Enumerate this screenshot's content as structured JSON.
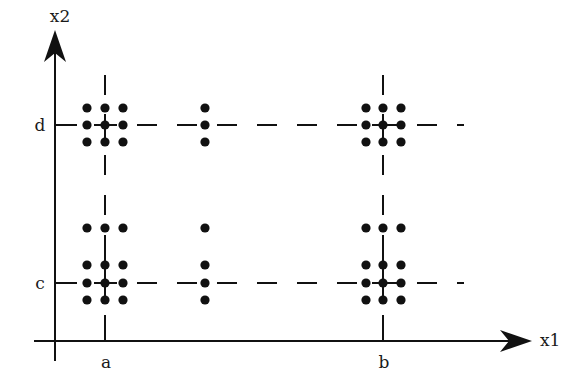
{
  "diagram": {
    "type": "design-points-grid",
    "axes": {
      "x": {
        "label": "x1",
        "ticks": [
          {
            "label": "a",
            "pos": 105
          },
          {
            "label": "b",
            "pos": 383
          }
        ]
      },
      "y": {
        "label": "x2",
        "ticks": [
          {
            "label": "d",
            "pos": 125
          },
          {
            "label": "c",
            "pos": 283
          }
        ]
      }
    },
    "colors": {
      "ink": "#111111",
      "background": "#ffffff"
    },
    "clusters": [
      {
        "name": "cluster-a-d",
        "cx": 105,
        "cy": 125,
        "xs": [
          87,
          105,
          123
        ],
        "ys": [
          108,
          125,
          142
        ]
      },
      {
        "name": "cluster-mid-d",
        "cx": 205,
        "cy": 125,
        "xs": [
          205
        ],
        "ys": [
          108,
          125,
          142
        ]
      },
      {
        "name": "cluster-b-d",
        "cx": 383,
        "cy": 125,
        "xs": [
          366,
          383,
          401
        ],
        "ys": [
          108,
          125,
          142
        ]
      },
      {
        "name": "cluster-a-c",
        "cx": 105,
        "cy": 283,
        "xs": [
          87,
          105,
          123
        ],
        "ys": [
          228,
          265,
          283,
          300
        ]
      },
      {
        "name": "cluster-mid-c",
        "cx": 205,
        "cy": 283,
        "xs": [
          205
        ],
        "ys": [
          228,
          265,
          283,
          300
        ]
      },
      {
        "name": "cluster-b-c",
        "cx": 383,
        "cy": 283,
        "xs": [
          366,
          383,
          401
        ],
        "ys": [
          228,
          265,
          283,
          300
        ]
      }
    ]
  }
}
